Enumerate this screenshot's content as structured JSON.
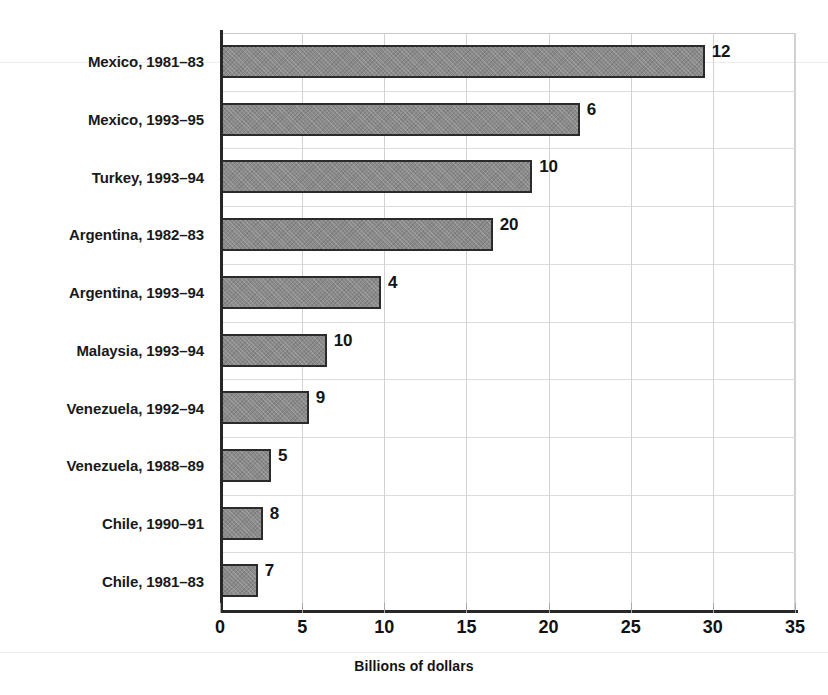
{
  "chart_data": {
    "type": "bar",
    "orientation": "horizontal",
    "title": "",
    "xlabel": "Billions of dollars",
    "ylabel": "",
    "xlim": [
      0,
      35
    ],
    "xticks": [
      0,
      5,
      10,
      15,
      20,
      25,
      30,
      35
    ],
    "grid": true,
    "legend": null,
    "categories": [
      "Mexico, 1981–83",
      "Mexico, 1993–95",
      "Turkey, 1993–94",
      "Argentina, 1982–83",
      "Argentina, 1993–94",
      "Malaysia, 1993–94",
      "Venezuela, 1992–94",
      "Venezuela, 1988–89",
      "Chile, 1990–91",
      "Chile, 1981–83"
    ],
    "values": [
      29.5,
      21.9,
      19.0,
      16.6,
      9.8,
      6.5,
      5.4,
      3.1,
      2.6,
      2.3
    ],
    "point_labels": [
      "12",
      "6",
      "10",
      "20",
      "4",
      "10",
      "9",
      "5",
      "8",
      "7"
    ],
    "bar_color": "#8a8a8a",
    "bar_border_color": "#2b2b2b",
    "axis_color": "#272727",
    "grid_color": "#d2d2d2"
  },
  "axis": {
    "x_title": "Billions of dollars"
  },
  "artifacts": {
    "top_clipped_line": " "
  }
}
